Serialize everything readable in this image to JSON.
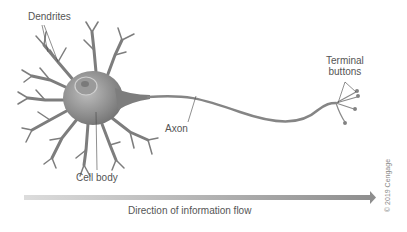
{
  "diagram": {
    "labels": {
      "dendrites": "Dendrites",
      "terminal_line1": "Terminal",
      "terminal_line2": "buttons",
      "axon": "Axon",
      "cell_body": "Cell body",
      "flow": "Direction of information flow",
      "copyright": "© 2019 Cengage"
    },
    "colors": {
      "neuron": "#8a8a8a",
      "neuron_dark": "#6e6e6e",
      "arrow_start": "#d8d8d8",
      "arrow_end": "#8f8f8f",
      "text": "#555555",
      "leader": "#444444"
    }
  }
}
